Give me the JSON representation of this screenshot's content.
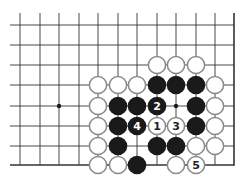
{
  "diagram": {
    "type": "go-board-fragment",
    "columns_x": [
      20,
      40,
      59,
      79,
      98,
      118,
      137,
      157,
      176,
      196,
      215
    ],
    "rows_y": [
      25,
      45,
      65,
      85,
      106,
      126,
      146,
      165
    ],
    "right_edge_x": 234,
    "bottom_edge_row": 7,
    "star_points": [
      {
        "col": 2,
        "row": 4
      },
      {
        "col": 8,
        "row": 4
      }
    ],
    "colors": {
      "line": "#333333",
      "black_stone": "#1a1a1a",
      "white_stone_fill": "#ffffff",
      "white_stone_outline": "#8a8a8a",
      "label_on_black": "#ffffff",
      "label_on_white": "#222222"
    },
    "stones": [
      {
        "col": 7,
        "row": 2,
        "color": "white"
      },
      {
        "col": 8,
        "row": 2,
        "color": "white"
      },
      {
        "col": 9,
        "row": 2,
        "color": "white"
      },
      {
        "col": 4,
        "row": 3,
        "color": "white"
      },
      {
        "col": 5,
        "row": 3,
        "color": "white"
      },
      {
        "col": 6,
        "row": 3,
        "color": "white"
      },
      {
        "col": 7,
        "row": 3,
        "color": "black"
      },
      {
        "col": 8,
        "row": 3,
        "color": "black"
      },
      {
        "col": 9,
        "row": 3,
        "color": "black"
      },
      {
        "col": 10,
        "row": 3,
        "color": "white"
      },
      {
        "col": 4,
        "row": 4,
        "color": "white"
      },
      {
        "col": 5,
        "row": 4,
        "color": "black"
      },
      {
        "col": 6,
        "row": 4,
        "color": "black"
      },
      {
        "col": 7,
        "row": 4,
        "color": "black",
        "label": "2"
      },
      {
        "col": 9,
        "row": 4,
        "color": "black"
      },
      {
        "col": 10,
        "row": 4,
        "color": "white"
      },
      {
        "col": 4,
        "row": 5,
        "color": "white"
      },
      {
        "col": 5,
        "row": 5,
        "color": "black"
      },
      {
        "col": 6,
        "row": 5,
        "color": "black",
        "label": "4"
      },
      {
        "col": 7,
        "row": 5,
        "color": "white",
        "label": "1"
      },
      {
        "col": 8,
        "row": 5,
        "color": "white",
        "label": "3"
      },
      {
        "col": 9,
        "row": 5,
        "color": "black"
      },
      {
        "col": 10,
        "row": 5,
        "color": "white"
      },
      {
        "col": 4,
        "row": 6,
        "color": "white"
      },
      {
        "col": 5,
        "row": 6,
        "color": "black"
      },
      {
        "col": 7,
        "row": 6,
        "color": "black"
      },
      {
        "col": 8,
        "row": 6,
        "color": "black"
      },
      {
        "col": 9,
        "row": 6,
        "color": "white"
      },
      {
        "col": 10,
        "row": 6,
        "color": "white"
      },
      {
        "col": 4,
        "row": 7,
        "color": "white"
      },
      {
        "col": 5,
        "row": 7,
        "color": "white"
      },
      {
        "col": 6,
        "row": 7,
        "color": "black"
      },
      {
        "col": 8,
        "row": 7,
        "color": "white"
      },
      {
        "col": 9,
        "row": 7,
        "color": "white",
        "label": "5"
      }
    ]
  }
}
